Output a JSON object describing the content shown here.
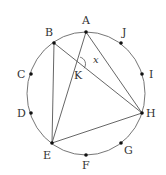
{
  "diagram": {
    "type": "geometry",
    "circle": {
      "cx": 86,
      "cy": 93.5,
      "rx": 59,
      "ry": 61.5,
      "stroke": "#666666"
    },
    "points": [
      {
        "name": "A",
        "x": 86,
        "y": 32,
        "label_x": 82,
        "label_y": 24
      },
      {
        "name": "B",
        "x": 54,
        "y": 43,
        "label_x": 45,
        "label_y": 36
      },
      {
        "name": "C",
        "x": 31,
        "y": 74,
        "label_x": 17,
        "label_y": 78
      },
      {
        "name": "D",
        "x": 31,
        "y": 113,
        "label_x": 17,
        "label_y": 117
      },
      {
        "name": "E",
        "x": 52,
        "y": 143,
        "label_x": 43,
        "label_y": 159
      },
      {
        "name": "F",
        "x": 86,
        "y": 155,
        "label_x": 82,
        "label_y": 169
      },
      {
        "name": "G",
        "x": 121,
        "y": 143,
        "label_x": 124,
        "label_y": 154
      },
      {
        "name": "H",
        "x": 142,
        "y": 113,
        "label_x": 146,
        "label_y": 117
      },
      {
        "name": "I",
        "x": 142,
        "y": 74,
        "label_x": 149,
        "label_y": 78
      },
      {
        "name": "J",
        "x": 121,
        "y": 43,
        "label_x": 122,
        "label_y": 36
      }
    ],
    "intersection": {
      "name": "K",
      "x": 78.5,
      "y": 64,
      "label_x": 74,
      "label_y": 79
    },
    "angle_label": {
      "text": "x",
      "x": 93,
      "y": 63
    },
    "segments": [
      [
        "B",
        "E"
      ],
      [
        "B",
        "H"
      ],
      [
        "A",
        "E"
      ],
      [
        "A",
        "H"
      ],
      [
        "E",
        "H"
      ]
    ],
    "line_color": "#555555",
    "point_color": "#111111"
  }
}
